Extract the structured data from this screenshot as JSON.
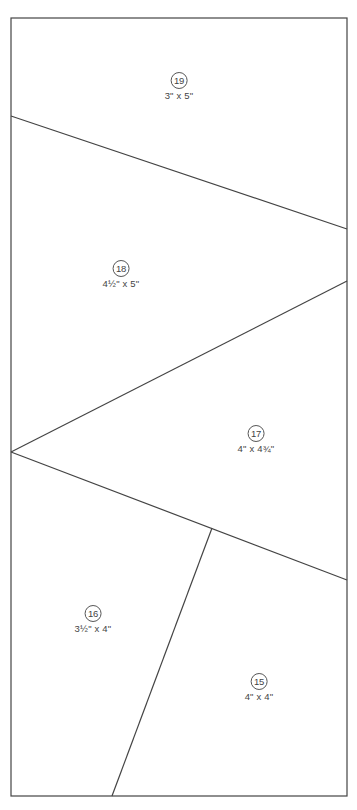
{
  "diagram": {
    "type": "foundation paper piecing template",
    "stroke_color": "#444444",
    "border": {
      "x1": 11,
      "y1": 18,
      "x2": 347,
      "y2": 796
    },
    "seam_lines": [
      {
        "id": "line-19-18",
        "x1": 11,
        "y1": 116,
        "x2": 347,
        "y2": 229
      },
      {
        "id": "line-18-17",
        "x1": 11,
        "y1": 452,
        "x2": 347,
        "y2": 281
      },
      {
        "id": "line-17-16-15",
        "x1": 11,
        "y1": 452,
        "x2": 347,
        "y2": 580
      },
      {
        "id": "line-16-15",
        "x1": 212,
        "y1": 528,
        "x2": 112,
        "y2": 796
      }
    ],
    "pieces": [
      {
        "number": "19",
        "size": "3\" x 5\"",
        "x": 179,
        "y": 72
      },
      {
        "number": "18",
        "size": "4½\" x 5\"",
        "x": 121,
        "y": 260
      },
      {
        "number": "17",
        "size": "4\" x 4¾\"",
        "x": 256,
        "y": 425
      },
      {
        "number": "16",
        "size": "3½\" x 4\"",
        "x": 93,
        "y": 605
      },
      {
        "number": "15",
        "size": "4\" x 4\"",
        "x": 259,
        "y": 673
      }
    ]
  }
}
